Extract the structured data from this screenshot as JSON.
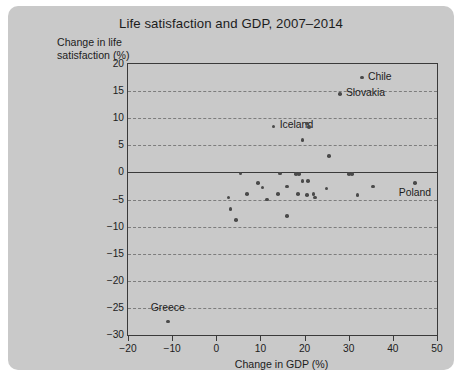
{
  "figure": {
    "title": "Life satisfaction and GDP, 2007–2014",
    "ylabel": "Change in life\nsatisfaction (%)",
    "xlabel": "Change in GDP (%)",
    "background_color": "#c9c9c9",
    "marker_color": "#4a4a4a",
    "axis_color": "#3a3a3a",
    "grid_color": "#7d7d7d"
  },
  "chart_data": {
    "type": "scatter",
    "title": "Life satisfaction and GDP, 2007–2014",
    "xlabel": "Change in GDP (%)",
    "ylabel": "Change in life satisfaction (%)",
    "xlim": [
      -20,
      50
    ],
    "ylim": [
      -30,
      20
    ],
    "xticks": [
      -20,
      -10,
      0,
      10,
      20,
      30,
      40,
      50
    ],
    "yticks": [
      -30,
      -25,
      -20,
      -15,
      -10,
      -5,
      0,
      5,
      10,
      15,
      20
    ],
    "grid": "horizontal-dashed",
    "legend": "none",
    "zero_line_y": 0,
    "points": [
      {
        "label": "Chile",
        "x": 33.0,
        "y": 17.5,
        "label_pos": "right"
      },
      {
        "label": "Slovakia",
        "x": 28.0,
        "y": 14.5,
        "label_pos": "right"
      },
      {
        "label": "Iceland",
        "x": 13.0,
        "y": 8.5,
        "label_pos": "right"
      },
      {
        "label": "Greece",
        "x": -11.0,
        "y": -27.5,
        "label_pos": "above"
      },
      {
        "label": "Poland",
        "x": 45.0,
        "y": -2.0,
        "label_pos": "below"
      },
      {
        "label": "",
        "x": 20.5,
        "y": 9.0
      },
      {
        "label": "",
        "x": 21.0,
        "y": 8.4
      },
      {
        "label": "",
        "x": 19.5,
        "y": 6.0
      },
      {
        "label": "",
        "x": 25.5,
        "y": 3.0
      },
      {
        "label": "",
        "x": 5.5,
        "y": -0.2
      },
      {
        "label": "",
        "x": 14.5,
        "y": -0.2
      },
      {
        "label": "",
        "x": 18.0,
        "y": -0.3
      },
      {
        "label": "",
        "x": 18.7,
        "y": -0.3
      },
      {
        "label": "",
        "x": 30.0,
        "y": -0.3
      },
      {
        "label": "",
        "x": 30.8,
        "y": -0.3
      },
      {
        "label": "",
        "x": 9.5,
        "y": -2.0
      },
      {
        "label": "",
        "x": 19.5,
        "y": -1.6
      },
      {
        "label": "",
        "x": 20.8,
        "y": -1.6
      },
      {
        "label": "",
        "x": 10.5,
        "y": -2.8
      },
      {
        "label": "",
        "x": 16.0,
        "y": -2.6
      },
      {
        "label": "",
        "x": 25.0,
        "y": -3.0
      },
      {
        "label": "",
        "x": 35.5,
        "y": -2.6
      },
      {
        "label": "",
        "x": 7.0,
        "y": -4.0
      },
      {
        "label": "",
        "x": 14.0,
        "y": -4.0
      },
      {
        "label": "",
        "x": 18.5,
        "y": -4.0
      },
      {
        "label": "",
        "x": 20.5,
        "y": -4.2
      },
      {
        "label": "",
        "x": 22.0,
        "y": -4.0
      },
      {
        "label": "",
        "x": 22.4,
        "y": -4.6
      },
      {
        "label": "",
        "x": 32.0,
        "y": -4.2
      },
      {
        "label": "",
        "x": 2.8,
        "y": -4.6
      },
      {
        "label": "",
        "x": 11.5,
        "y": -5.0
      },
      {
        "label": "",
        "x": 3.2,
        "y": -6.8
      },
      {
        "label": "",
        "x": 16.0,
        "y": -8.0
      },
      {
        "label": "",
        "x": 4.5,
        "y": -8.8
      }
    ]
  }
}
